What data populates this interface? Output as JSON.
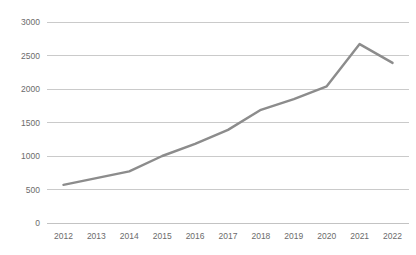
{
  "chart_data": {
    "type": "line",
    "title": "",
    "subtitle": "",
    "xlabel": "",
    "ylabel": "",
    "categories": [
      "2012",
      "2013",
      "2014",
      "2015",
      "2016",
      "2017",
      "2018",
      "2019",
      "2020",
      "2021",
      "2022"
    ],
    "values": [
      570,
      670,
      770,
      1000,
      1180,
      1390,
      1690,
      1850,
      2040,
      2670,
      2390
    ],
    "series": [
      {
        "name": "Series 1",
        "values": [
          570,
          670,
          770,
          1000,
          1180,
          1390,
          1690,
          1850,
          2040,
          2670,
          2390
        ]
      }
    ],
    "ylim": [
      0,
      3000
    ],
    "ytick_labels": [
      "0",
      "500",
      "1000",
      "1500",
      "2000",
      "2500",
      "3000"
    ],
    "ytick_values": [
      0,
      500,
      1000,
      1500,
      2000,
      2500,
      3000
    ],
    "xtick_labels": [
      "2012",
      "2013",
      "2014",
      "2015",
      "2016",
      "2017",
      "2018",
      "2019",
      "2020",
      "2021",
      "2022"
    ],
    "grid": true,
    "grid_axis": "y",
    "legend": false,
    "legend_position": "none",
    "line_color": "#8c8c8c",
    "grid_color": "#bdbdbd",
    "tick_label_color": "#6b6b6b",
    "background_color": "#ffffff"
  }
}
